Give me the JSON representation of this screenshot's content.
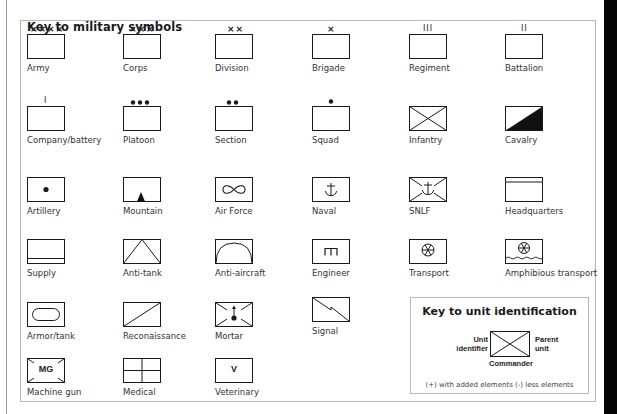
{
  "title": "Key to military symbols",
  "symbols": [
    {
      "id": "army",
      "label": "Army",
      "marker": "××××"
    },
    {
      "id": "corps",
      "label": "Corps",
      "marker": "×××"
    },
    {
      "id": "division",
      "label": "Division",
      "marker": "××"
    },
    {
      "id": "brigade",
      "label": "Brigade",
      "marker": "×"
    },
    {
      "id": "regiment",
      "label": "Regiment",
      "marker": "III"
    },
    {
      "id": "battalion",
      "label": "Battalion",
      "marker": "II"
    },
    {
      "id": "company",
      "label": "Company/battery",
      "marker": "I"
    },
    {
      "id": "platoon",
      "label": "Platoon",
      "marker": "●●●"
    },
    {
      "id": "section",
      "label": "Section",
      "marker": "●●"
    },
    {
      "id": "squad",
      "label": "Squad",
      "marker": "●"
    },
    {
      "id": "infantry",
      "label": "Infantry",
      "marker": ""
    },
    {
      "id": "cavalry",
      "label": "Cavalry",
      "marker": ""
    },
    {
      "id": "artillery",
      "label": "Artillery",
      "marker": ""
    },
    {
      "id": "mountain",
      "label": "Mountain",
      "marker": ""
    },
    {
      "id": "air-force",
      "label": "Air Force",
      "marker": ""
    },
    {
      "id": "naval",
      "label": "Naval",
      "marker": "⚓"
    },
    {
      "id": "snlf",
      "label": "SNLF",
      "marker": "⚓"
    },
    {
      "id": "headquarters",
      "label": "Headquarters",
      "marker": ""
    },
    {
      "id": "supply",
      "label": "Supply",
      "marker": ""
    },
    {
      "id": "anti-tank",
      "label": "Anti-tank",
      "marker": ""
    },
    {
      "id": "anti-aircraft",
      "label": "Anti-aircraft",
      "marker": ""
    },
    {
      "id": "engineer",
      "label": "Engineer",
      "marker": "ᴨ"
    },
    {
      "id": "transport",
      "label": "Transport",
      "marker": ""
    },
    {
      "id": "amphibious-transport",
      "label": "Amphibious transport",
      "marker": ""
    },
    {
      "id": "armor",
      "label": "Armor/tank",
      "marker": ""
    },
    {
      "id": "reconnaissance",
      "label": "Reconaissance",
      "marker": ""
    },
    {
      "id": "mortar",
      "label": "Mortar",
      "marker": ""
    },
    {
      "id": "signal",
      "label": "Signal",
      "marker": ""
    },
    {
      "id": "machine-gun",
      "label": "Machine gun",
      "marker": "MG"
    },
    {
      "id": "medical",
      "label": "Medical",
      "marker": ""
    },
    {
      "id": "veterinary",
      "label": "Veterinary",
      "marker": "V"
    }
  ],
  "unit_key": {
    "title": "Key to unit identification",
    "unit_identifier_line1": "Unit",
    "unit_identifier_line2": "identifier",
    "parent_unit_line1": "Parent",
    "parent_unit_line2": "unit",
    "commander": "Commander",
    "footnote": "(+) with added elements   (-) less elements"
  },
  "colors": {
    "line": "#1a1a1a",
    "border": "#b8b8b8",
    "text": "#333333"
  }
}
